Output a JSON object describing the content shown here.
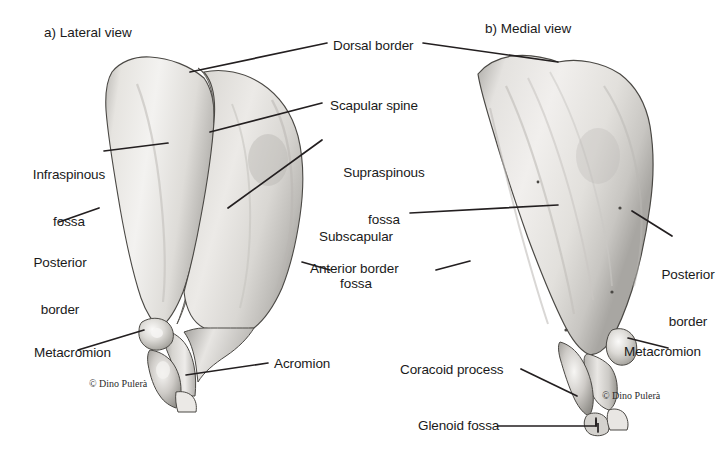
{
  "figure": {
    "background_color": "#ffffff",
    "line_color": "#231f20",
    "text_color": "#1a1a1a",
    "bone_fill_light": "#f2f1ef",
    "bone_fill_mid": "#d8d6d2",
    "bone_fill_dark": "#a7a5a1"
  },
  "panels": [
    {
      "id": "lateral",
      "title": "a) Lateral view"
    },
    {
      "id": "medial",
      "title": "b) Medial view"
    }
  ],
  "credits": [
    {
      "id": "credit-left",
      "text": "© Dino Pulerà"
    },
    {
      "id": "credit-right",
      "text": "© Dino Pulerà"
    }
  ],
  "labels": [
    {
      "id": "dorsal-border",
      "text": "Dorsal border",
      "line1": "Dorsal border",
      "line2": ""
    },
    {
      "id": "scapular-spine",
      "text": "Scapular spine",
      "line1": "Scapular spine",
      "line2": ""
    },
    {
      "id": "supraspinous-fossa",
      "text": "Supraspinous fossa",
      "line1": "Supraspinous",
      "line2": "fossa"
    },
    {
      "id": "infraspinous-fossa",
      "text": "Infraspinous fossa",
      "line1": "Infraspinous",
      "line2": "fossa"
    },
    {
      "id": "posterior-border-left",
      "text": "Posterior border",
      "line1": "Posterior",
      "line2": "border"
    },
    {
      "id": "subscapular-fossa",
      "text": "Subscapular fossa",
      "line1": "Subscapular",
      "line2": "fossa"
    },
    {
      "id": "anterior-border",
      "text": "Anterior border",
      "line1": "Anterior border",
      "line2": ""
    },
    {
      "id": "posterior-border-right",
      "text": "Posterior border",
      "line1": "Posterior",
      "line2": "border"
    },
    {
      "id": "metacromion-left",
      "text": "Metacromion",
      "line1": "Metacromion",
      "line2": ""
    },
    {
      "id": "metacromion-right",
      "text": "Metacromion",
      "line1": "Metacromion",
      "line2": ""
    },
    {
      "id": "acromion",
      "text": "Acromion",
      "line1": "Acromion",
      "line2": ""
    },
    {
      "id": "coracoid-process",
      "text": "Coracoid process",
      "line1": "Coracoid process",
      "line2": ""
    },
    {
      "id": "glenoid-fossa",
      "text": "Glenoid fossa",
      "line1": "Glenoid fossa",
      "line2": ""
    }
  ]
}
